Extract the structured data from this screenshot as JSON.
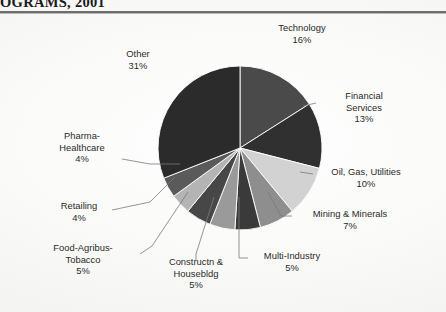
{
  "header": {
    "title": "OGRAMS, 2001"
  },
  "chart_data": {
    "type": "pie",
    "title": "",
    "subtitle": "",
    "xlabel": "",
    "ylabel": "",
    "legend_position": "callout-labels",
    "grid": false,
    "value_unit": "%",
    "start_angle_deg": -90,
    "direction": "clockwise",
    "categories": [
      "Technology",
      "Financial Services",
      "Oil, Gas, Utilities",
      "Mining & Minerals",
      "Multi-Industry",
      "Constructn & Housebldg",
      "Food-Agribus-Tobacco",
      "Retailing",
      "Pharma-Healthcare",
      "Other"
    ],
    "values": [
      16,
      13,
      10,
      7,
      5,
      5,
      5,
      4,
      4,
      31
    ],
    "slice_colors": [
      "#4a4a4a",
      "#303030",
      "#d2d2d2",
      "#8e8e8e",
      "#3a3a3a",
      "#9a9a9a",
      "#474747",
      "#b4b4b4",
      "#5a5a5a",
      "#2b2b2b"
    ],
    "labels": [
      {
        "name": "Technology",
        "value": "16%"
      },
      {
        "name": "Financial\nServices",
        "value": "13%"
      },
      {
        "name": "Oil, Gas, Utilities",
        "value": "10%"
      },
      {
        "name": "Mining & Minerals",
        "value": "7%"
      },
      {
        "name": "Multi-Industry",
        "value": "5%"
      },
      {
        "name": "Constructn &\nHousebldg",
        "value": "5%"
      },
      {
        "name": "Food-Agribus-\nTobacco",
        "value": "5%"
      },
      {
        "name": "Retailing",
        "value": "4%"
      },
      {
        "name": "Pharma-\nHealthcare",
        "value": "4%"
      },
      {
        "name": "Other",
        "value": "31%"
      }
    ]
  },
  "labels": {
    "technology": {
      "l1": "Technology",
      "val": "16%"
    },
    "financial": {
      "l1": "Financial",
      "l2": "Services",
      "val": "13%"
    },
    "oilgas": {
      "l1": "Oil, Gas, Utilities",
      "val": "10%"
    },
    "mining": {
      "l1": "Mining & Minerals",
      "val": "7%"
    },
    "multi": {
      "l1": "Multi-Industry",
      "val": "5%"
    },
    "construct": {
      "l1": "Constructn &",
      "l2": "Housebldg",
      "val": "5%"
    },
    "food": {
      "l1": "Food-Agribus-",
      "l2": "Tobacco",
      "val": "5%"
    },
    "retailing": {
      "l1": "Retailing",
      "val": "4%"
    },
    "pharma": {
      "l1": "Pharma-",
      "l2": "Healthcare",
      "val": "4%"
    },
    "other": {
      "l1": "Other",
      "val": "31%"
    }
  }
}
